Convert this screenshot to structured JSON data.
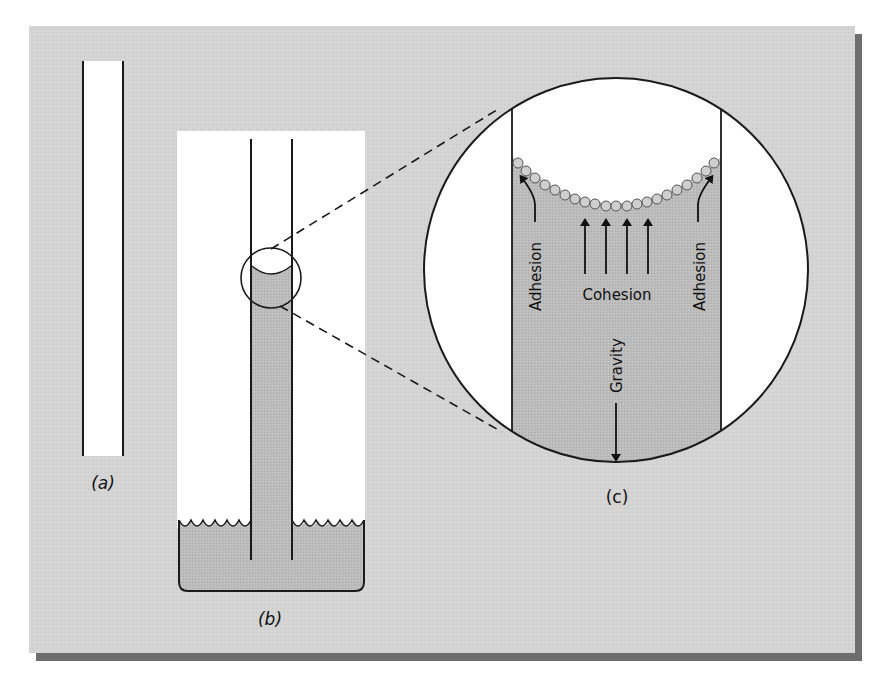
{
  "figure": {
    "panel_color": "#d3d3d3",
    "shadow_color": "#6b6b6b",
    "water_color": "#bdbdbd",
    "line_color": "#1a1a1a",
    "labels": {
      "a": "(a)",
      "b": "(b)",
      "c": "(c)"
    },
    "forces": {
      "adhesion_left": "Adhesion",
      "adhesion_right": "Adhesion",
      "cohesion": "Cohesion",
      "gravity": "Gravity"
    },
    "subfigures": [
      {
        "id": "a",
        "description": "Empty glass capillary tube"
      },
      {
        "id": "b",
        "description": "Capillary tube standing in a beaker of water, water risen inside tube with concave meniscus"
      },
      {
        "id": "c",
        "description": "Magnified view of meniscus showing water molecules, adhesion to tube walls, cohesion between molecules, and gravity pulling down"
      }
    ]
  }
}
